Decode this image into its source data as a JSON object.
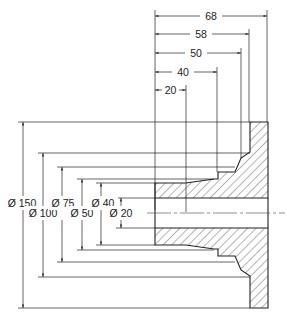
{
  "drawing": {
    "title": "Flange cross-section with dimensions",
    "horizontal_dimensions": [
      {
        "label": "68",
        "y": 16,
        "x2": 267
      },
      {
        "label": "58",
        "y": 34,
        "x2": 249
      },
      {
        "label": "50",
        "y": 53,
        "x2": 241
      },
      {
        "label": "40",
        "y": 72,
        "x2": 217
      },
      {
        "label": "20",
        "y": 90,
        "x2": 186
      }
    ],
    "diameter_dimensions": [
      {
        "label": "Ø 150",
        "x": 23,
        "y1": 122,
        "y2": 308
      },
      {
        "label": "Ø 100",
        "x": 43,
        "y1": 153,
        "y2": 277
      },
      {
        "label": "Ø 75",
        "x": 62,
        "y1": 167,
        "y2": 262
      },
      {
        "label": "Ø 50",
        "x": 82,
        "y1": 179,
        "y2": 250
      },
      {
        "label": "Ø 40",
        "x": 101,
        "y1": 183,
        "y2": 245
      },
      {
        "label": "Ø 20",
        "x": 121,
        "y1": 198,
        "y2": 228
      }
    ],
    "colors": {
      "line": "#222222",
      "hatch": "#444444",
      "background": "#ffffff"
    }
  }
}
